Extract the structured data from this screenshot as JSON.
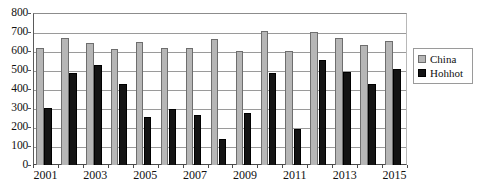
{
  "chart_data": {
    "type": "bar",
    "title": "",
    "subtitle": "",
    "xlabel": "",
    "ylabel": "",
    "ylim": [
      0,
      800
    ],
    "ytick_step": 100,
    "yticks": [
      800,
      700,
      600,
      500,
      400,
      300,
      200,
      100,
      0
    ],
    "grid": true,
    "grid_axis": "y",
    "legend_position": "right",
    "categories": [
      "2001",
      "2002",
      "2003",
      "2004",
      "2005",
      "2006",
      "2007",
      "2008",
      "2009",
      "2010",
      "2011",
      "2012",
      "2013",
      "2014",
      "2015"
    ],
    "xtick_labels": [
      "2001",
      "2003",
      "2005",
      "2007",
      "2009",
      "2011",
      "2013",
      "2015"
    ],
    "series": [
      {
        "name": "China",
        "color": "#b6b6b6",
        "values": [
          615,
          668,
          640,
          608,
          648,
          618,
          617,
          665,
          600,
          705,
          600,
          700,
          670,
          630,
          655
        ]
      },
      {
        "name": "Hohhot",
        "color": "#141414",
        "values": [
          300,
          485,
          525,
          425,
          252,
          296,
          265,
          138,
          275,
          485,
          190,
          555,
          490,
          425,
          505
        ]
      }
    ]
  },
  "legend": {
    "items": [
      {
        "label": "China",
        "color": "#b6b6b6"
      },
      {
        "label": "Hohhot",
        "color": "#141414"
      }
    ]
  },
  "colors": {
    "china": "#b6b6b6",
    "hohhot": "#141414",
    "gridline": "#9a9a9a",
    "axis": "#4a4a4a",
    "background": "#ffffff"
  }
}
